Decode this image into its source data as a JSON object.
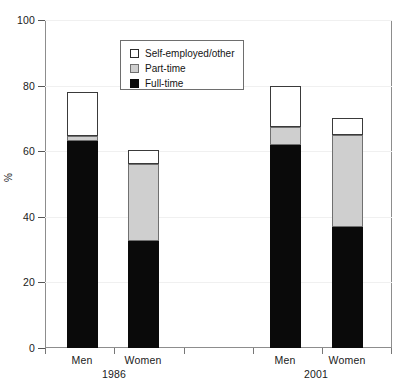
{
  "chart_data": {
    "type": "bar",
    "subtype": "stacked",
    "title": "",
    "xlabel": "",
    "ylabel": "%",
    "ylim": [
      0,
      100
    ],
    "yticks": [
      0,
      20,
      40,
      60,
      80,
      100
    ],
    "grid": true,
    "legend_position": "top-center-inside",
    "categories": [
      "Men",
      "Women",
      "Men",
      "Women"
    ],
    "groups": [
      {
        "label": "1986",
        "categories": [
          "Men",
          "Women"
        ]
      },
      {
        "label": "2001",
        "categories": [
          "Men",
          "Women"
        ]
      }
    ],
    "series": [
      {
        "name": "Full-time",
        "color": "#0a0a0a",
        "values": [
          63,
          32.5,
          62,
          37
        ]
      },
      {
        "name": "Part-time",
        "color": "#cfcfcf",
        "values": [
          1.5,
          23.5,
          5.5,
          28
        ]
      },
      {
        "name": "Self-employed/other",
        "color": "#ffffff",
        "values": [
          13.5,
          4.5,
          12.5,
          5
        ]
      }
    ],
    "totals": [
      78,
      60.5,
      80,
      70
    ],
    "cumulative": {
      "full_time_top": [
        63,
        32.5,
        62,
        37
      ],
      "part_time_top": [
        64.5,
        56,
        67.5,
        65
      ],
      "self_employed_top": [
        78,
        60.5,
        80,
        70
      ]
    }
  },
  "axis": {
    "y_labels": [
      "100",
      "80",
      "60",
      "40",
      "20",
      "0"
    ],
    "y_title": "%"
  },
  "legend": {
    "items": [
      {
        "label": "Self-employed/other",
        "swatch": "white-square-icon"
      },
      {
        "label": "Part-time",
        "swatch": "gray-square-icon"
      },
      {
        "label": "Full-time",
        "swatch": "black-square-icon"
      }
    ]
  },
  "x_axis": {
    "bar_labels": [
      "Men",
      "Women",
      "Men",
      "Women"
    ],
    "group_labels": [
      "1986",
      "2001"
    ]
  }
}
